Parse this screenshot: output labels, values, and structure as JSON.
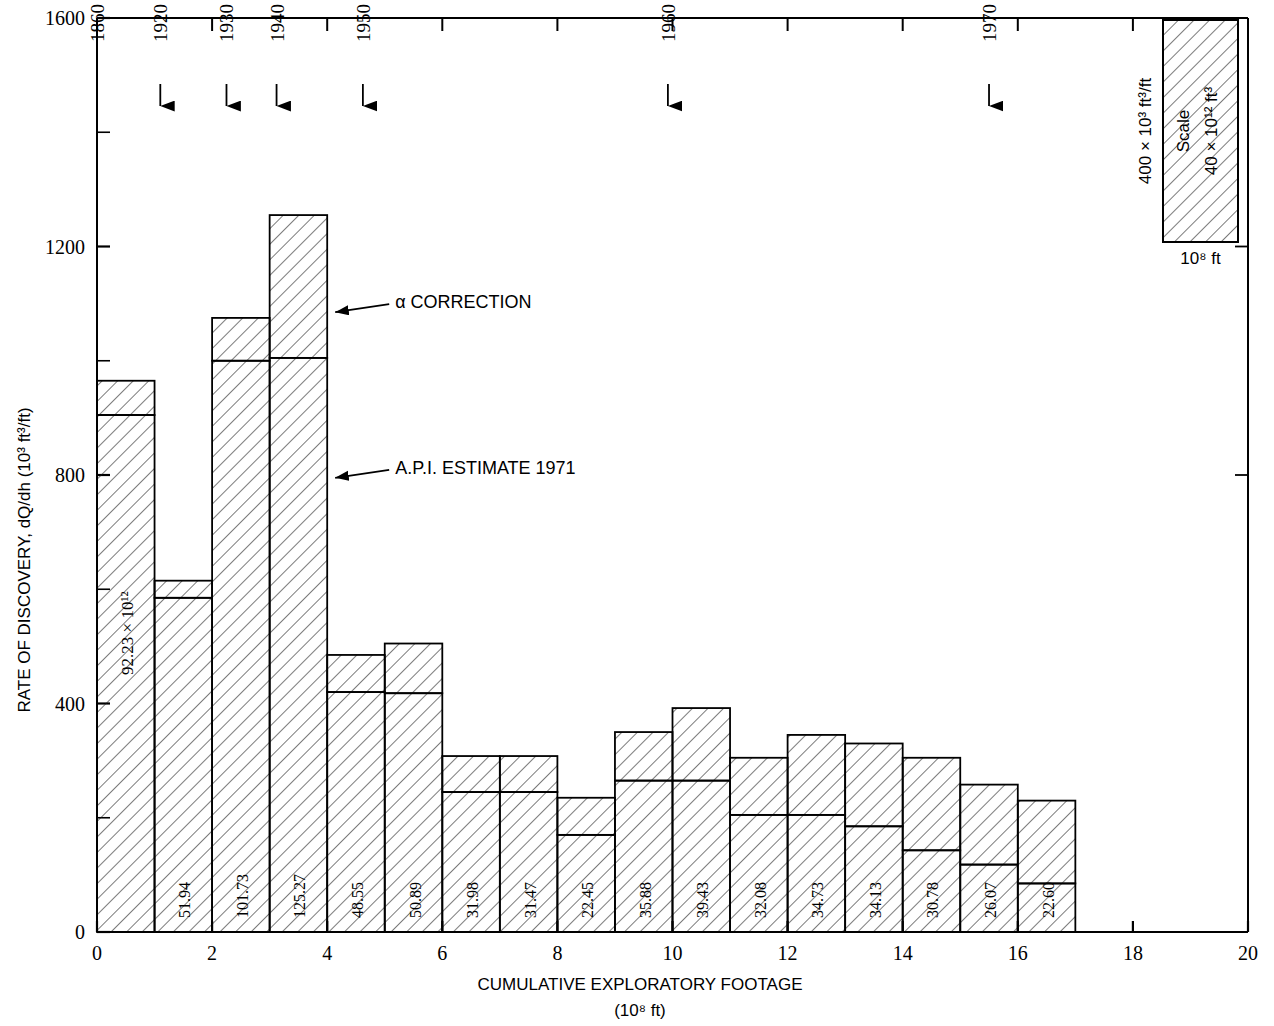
{
  "chart_data": {
    "type": "bar",
    "title": "",
    "xlabel": "CUMULATIVE EXPLORATORY FOOTAGE",
    "xlabel_units": "(10⁸ ft)",
    "ylabel": "RATE OF DISCOVERY, dQ/dh  (10³ ft³/ft)",
    "xlim": [
      0,
      20
    ],
    "ylim": [
      0,
      1600
    ],
    "xticks": [
      0,
      2,
      4,
      6,
      8,
      10,
      12,
      14,
      16,
      18,
      20
    ],
    "xtick_labels": [
      "0",
      "2",
      "4",
      "6",
      "8",
      "10",
      "12",
      "14",
      "16",
      "18",
      "20"
    ],
    "xminor_step": 1,
    "yticks": [
      0,
      400,
      800,
      1200,
      1600
    ],
    "ytick_labels": [
      "0",
      "400",
      "800",
      "1200",
      "1600"
    ],
    "yminor_step": 200,
    "grid": false,
    "legend_position": "top-right",
    "bar_width_units": 1,
    "series": [
      {
        "name": "A.P.I. ESTIMATE 1971",
        "values": [
          905,
          585,
          1000,
          1005,
          420,
          418,
          245,
          245,
          170,
          265,
          265,
          205,
          205,
          185,
          143,
          118,
          85
        ]
      },
      {
        "name": "α CORRECTION (increment to top)",
        "values": [
          965,
          615,
          1075,
          1255,
          485,
          505,
          308,
          308,
          235,
          350,
          392,
          305,
          345,
          330,
          305,
          258,
          230
        ]
      }
    ],
    "x_left_edges": [
      0,
      1,
      2,
      3,
      4,
      5,
      6,
      7,
      8,
      9,
      10,
      11,
      12,
      13,
      14,
      15,
      16
    ],
    "bar_value_labels": [
      "92.23 × 10¹²",
      "51.94",
      "101.73",
      "125.27",
      "48.55",
      "50.89",
      "31.98",
      "31.47",
      "22.45",
      "35.88",
      "39.43",
      "32.08",
      "34.73",
      "34.13",
      "30.78",
      "26.07",
      "22.60"
    ],
    "annotations": [
      {
        "text": "α CORRECTION",
        "target_x": 4.0,
        "target_y": 1085
      },
      {
        "text": "A.P.I. ESTIMATE 1971",
        "target_x": 4.0,
        "target_y": 795
      }
    ],
    "year_markers": [
      {
        "label": "1860",
        "x": 0.0,
        "arrow": false
      },
      {
        "label": "1920",
        "x": 1.1,
        "arrow": true
      },
      {
        "label": "1930",
        "x": 2.25,
        "arrow": true
      },
      {
        "label": "1940",
        "x": 3.12,
        "arrow": true
      },
      {
        "label": "1950",
        "x": 4.62,
        "arrow": true
      },
      {
        "label": "1960",
        "x": 9.92,
        "arrow": true
      },
      {
        "label": "1970",
        "x": 15.5,
        "arrow": true
      }
    ]
  },
  "scale_box": {
    "left_label": "400 × 10³ ft³/ft",
    "inner_label": "Scale",
    "inner_value": "40 × 10¹² ft³",
    "bottom_label": "10⁸ ft"
  },
  "caption": {
    "text": ""
  }
}
